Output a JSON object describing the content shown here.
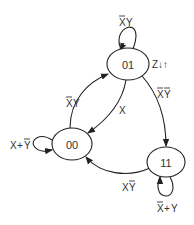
{
  "diagram": {
    "type": "state-machine",
    "states": [
      {
        "id": "s01",
        "label": "01"
      },
      {
        "id": "s00",
        "label": "00"
      },
      {
        "id": "s11",
        "label": "11"
      }
    ],
    "transitions": [
      {
        "from": "01",
        "to": "01",
        "label_parts": [
          "X",
          "Y"
        ],
        "negated": [
          true,
          false
        ],
        "label": "X̄Y"
      },
      {
        "from": "00",
        "to": "01",
        "label_parts": [
          "X",
          "Y"
        ],
        "negated": [
          true,
          false
        ],
        "label": "X̄Y"
      },
      {
        "from": "01",
        "to": "00",
        "label_parts": [
          "X"
        ],
        "negated": [
          false
        ],
        "label": "X"
      },
      {
        "from": "01",
        "to": "11",
        "label_parts": [
          "X",
          "Y"
        ],
        "negated": [
          true,
          true
        ],
        "label": "X̄Ȳ"
      },
      {
        "from": "11",
        "to": "00",
        "label_parts": [
          "X",
          "Y"
        ],
        "negated": [
          false,
          true
        ],
        "label": "XȲ"
      },
      {
        "from": "00",
        "to": "00",
        "label_parts": [
          "X",
          "+",
          "Y"
        ],
        "negated": [
          false,
          false,
          true
        ],
        "label": "X+Ȳ"
      },
      {
        "from": "11",
        "to": "11",
        "label_parts": [
          "X",
          "+",
          "Y"
        ],
        "negated": [
          true,
          false,
          false
        ],
        "label": "X̄+Y"
      }
    ],
    "outputs": {
      "state_01_output": "Z↓↑"
    },
    "colors": {
      "stroke": "#222222",
      "text": "#333333",
      "background": "#ffffff"
    }
  }
}
